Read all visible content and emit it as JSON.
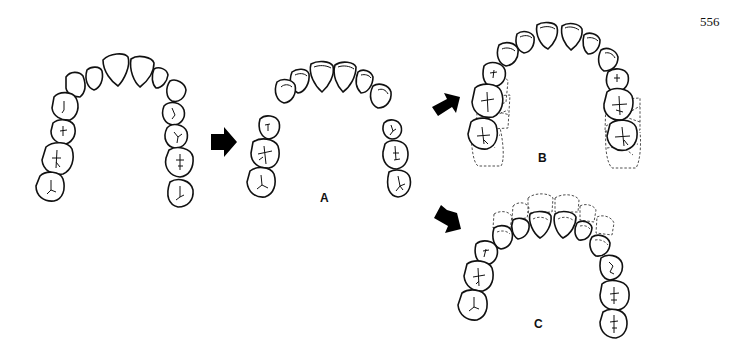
{
  "page_number": "556",
  "panels": [
    {
      "id": "original",
      "label": ""
    },
    {
      "id": "A",
      "label": "A"
    },
    {
      "id": "B",
      "label": "B"
    },
    {
      "id": "C",
      "label": "C"
    }
  ],
  "arrows": [
    {
      "id": "original-to-A",
      "direction": "right"
    },
    {
      "id": "A-to-B",
      "direction": "up-right"
    },
    {
      "id": "A-to-C",
      "direction": "down-right"
    }
  ],
  "legend": {
    "solid_outline": "tooth position",
    "dashed_outline": "original/alternative tooth position"
  }
}
